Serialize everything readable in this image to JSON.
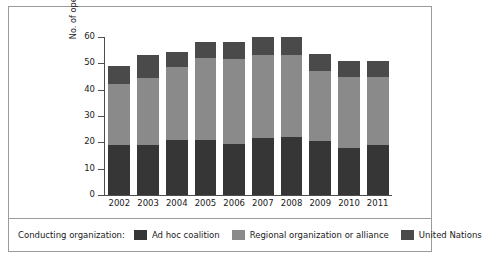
{
  "chart_data": {
    "type": "bar",
    "stacked": true,
    "title": "",
    "xlabel": "",
    "ylabel": "No. of operations",
    "ylim": [
      0,
      60
    ],
    "yticks": [
      0,
      10,
      20,
      30,
      40,
      50,
      60
    ],
    "grid": false,
    "legend_position": "bottom",
    "legend_title": "Conducting organization:",
    "categories": [
      "2002",
      "2003",
      "2004",
      "2005",
      "2006",
      "2007",
      "2008",
      "2009",
      "2010",
      "2011"
    ],
    "series": [
      {
        "name": "Ad hoc coalition",
        "color": "#363636",
        "values": [
          19,
          19,
          21,
          21,
          19.5,
          21.5,
          22,
          20.5,
          18,
          19
        ]
      },
      {
        "name": "Regional organization or alliance",
        "color": "#8a8a8a",
        "values": [
          23,
          25.5,
          27.5,
          31,
          32,
          31.5,
          31,
          26.5,
          27,
          26
        ]
      },
      {
        "name": "United Nations",
        "color": "#4a4a4a",
        "values": [
          7,
          8.5,
          6,
          6,
          6.5,
          7,
          7,
          6.5,
          6,
          6
        ]
      }
    ],
    "totals": [
      49,
      53,
      55,
      58,
      58,
      60,
      60,
      53.5,
      51,
      51
    ]
  },
  "legend": {
    "title": "Conducting organization:",
    "items": [
      {
        "label": "Ad hoc coalition",
        "color": "#363636"
      },
      {
        "label": "Regional organization or alliance",
        "color": "#8a8a8a"
      },
      {
        "label": "United Nations",
        "color": "#4a4a4a"
      }
    ]
  },
  "axes": {
    "y_title": "No. of operations",
    "y_ticks": [
      "60",
      "50",
      "40",
      "30",
      "20",
      "10",
      "0"
    ],
    "x_ticks": [
      "2002",
      "2003",
      "2004",
      "2005",
      "2006",
      "2007",
      "2008",
      "2009",
      "2010",
      "2011"
    ]
  }
}
